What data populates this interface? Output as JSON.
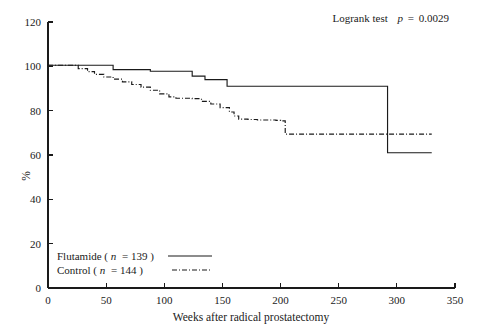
{
  "chart_data": {
    "type": "line",
    "title": "",
    "subtitle": "",
    "xlabel": "Weeks after radical prostatectomy",
    "ylabel": "%",
    "xlim": [
      0,
      350
    ],
    "ylim": [
      0,
      120
    ],
    "xticks": [
      0,
      50,
      100,
      150,
      200,
      250,
      300,
      350
    ],
    "yticks": [
      0,
      20,
      40,
      60,
      80,
      100,
      120
    ],
    "xtick_labels": [
      "0",
      "50",
      "100",
      "150",
      "200",
      "250",
      "300",
      "350"
    ],
    "ytick_labels": [
      "0",
      "20",
      "40",
      "60",
      "80",
      "100",
      "120"
    ],
    "grid": false,
    "legend_position": "lower-left",
    "annotations": [
      {
        "name": "logrank-annotation",
        "prefix": "Logrank test",
        "stat_symbol": "p",
        "stat_relation": "=",
        "stat_value": "0.0029",
        "full_text": "Logrank test  p = 0.0029"
      }
    ],
    "series": [
      {
        "name": "Flutamide",
        "legend_label": "Flutamide (n = 139)",
        "label_prefix": "Flutamide (",
        "n_symbol": "n",
        "n_value": "= 139",
        "label_suffix": ")",
        "n": 139,
        "linestyle": "solid",
        "color": "#1a1a1a",
        "x": [
          0,
          22,
          30,
          52,
          56,
          84,
          88,
          120,
          124,
          131,
          135,
          150,
          154,
          288,
          292,
          330
        ],
        "y": [
          100.5,
          100.5,
          100.5,
          100.5,
          98.5,
          98.5,
          97.8,
          97.8,
          95.6,
          95.6,
          94.0,
          94.0,
          91.0,
          91.0,
          61.0,
          61.0
        ]
      },
      {
        "name": "Control",
        "legend_label": "Control (n = 144)",
        "label_prefix": "Control (",
        "n_symbol": "n",
        "n_value": "= 144",
        "label_suffix": ")",
        "n": 144,
        "linestyle": "dashdot",
        "color": "#1a1a1a",
        "x": [
          0,
          20,
          26,
          34,
          40,
          48,
          56,
          64,
          72,
          80,
          88,
          96,
          104,
          110,
          118,
          124,
          132,
          140,
          148,
          156,
          160,
          164,
          172,
          180,
          196,
          200,
          204,
          330
        ],
        "y": [
          100.5,
          100.5,
          99.0,
          97.6,
          96.4,
          95.2,
          94.2,
          93.0,
          91.8,
          90.6,
          89.2,
          87.6,
          86.2,
          85.6,
          85.6,
          85.4,
          84.2,
          83.0,
          81.4,
          79.4,
          77.6,
          76.2,
          76.0,
          75.8,
          75.6,
          75.4,
          69.4,
          69.4
        ]
      }
    ]
  },
  "legend": {
    "name": "chart-legend",
    "entries": [
      {
        "label": "Flutamide (n = 139)",
        "linestyle": "solid"
      },
      {
        "label": "Control (n = 144)",
        "linestyle": "dashdot"
      }
    ]
  },
  "colors": {
    "line": "#1a1a1a",
    "axis": "#1a1a1a",
    "background": "#ffffff"
  }
}
